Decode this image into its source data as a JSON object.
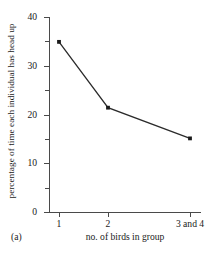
{
  "panel": {
    "label": "(a)"
  },
  "chart_data": {
    "type": "line",
    "title": "",
    "xlabel": "no. of birds in group",
    "ylabel": "percentage of time each individual has head up",
    "categories": [
      "1",
      "2",
      "3 and 4"
    ],
    "values": [
      34.9,
      21.4,
      15.1
    ],
    "series": [
      {
        "name": "percentage of time each individual has head up",
        "values": [
          34.9,
          21.4,
          15.1
        ]
      }
    ],
    "ylim": [
      0,
      40
    ],
    "yticks": [
      0,
      10,
      20,
      30,
      40
    ],
    "ytick_labels": [
      "0",
      "10",
      "20",
      "30",
      "40"
    ],
    "yticks_minor": [
      5,
      15,
      25,
      35
    ],
    "grid": false,
    "legend": false,
    "marker": "square",
    "line_color": "#2b2b2b",
    "marker_color": "#1a1a1a",
    "axis_color": "#4a4a4a",
    "background": "#ffffff"
  }
}
